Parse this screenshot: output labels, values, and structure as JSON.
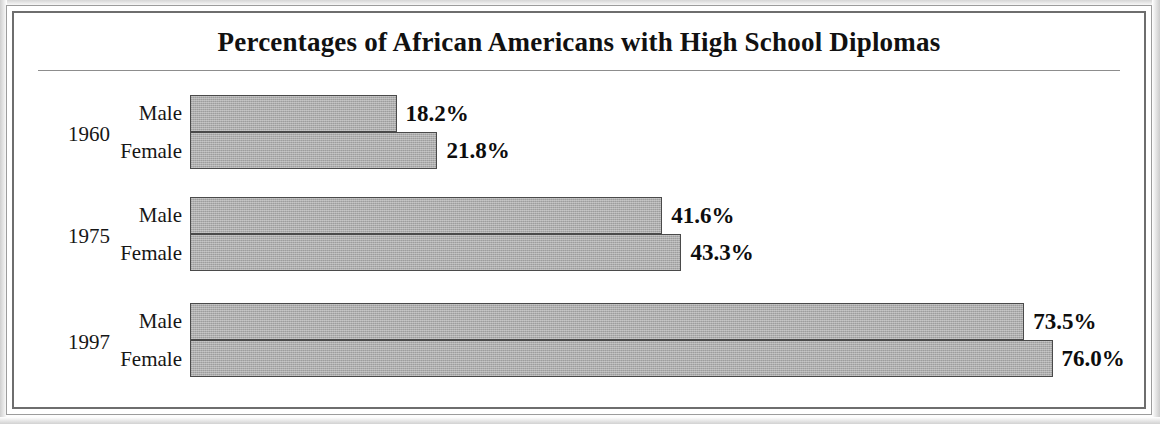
{
  "figure": {
    "title": "Percentages of African Americans with High School Diplomas",
    "background_color": "#ffffff",
    "bar_fill_color": "#a9a9a9",
    "bar_border_color": "#4a4a4a",
    "text_color": "#111111"
  },
  "chart_data": {
    "type": "bar",
    "orientation": "horizontal",
    "title": "Percentages of African Americans with High School Diplomas",
    "xlabel": "",
    "ylabel": "",
    "xlim": [
      0,
      76
    ],
    "grid": false,
    "legend": "none",
    "categories": [
      "1960",
      "1975",
      "1997"
    ],
    "series": [
      {
        "name": "Male",
        "values": [
          18.2,
          41.6,
          73.5
        ]
      },
      {
        "name": "Female",
        "values": [
          21.8,
          43.3,
          76.0
        ]
      }
    ],
    "groups": [
      {
        "year": "1960",
        "bars": [
          {
            "label": "Male",
            "value": 18.2,
            "value_text": "18.2%"
          },
          {
            "label": "Female",
            "value": 21.8,
            "value_text": "21.8%"
          }
        ]
      },
      {
        "year": "1975",
        "bars": [
          {
            "label": "Male",
            "value": 41.6,
            "value_text": "41.6%"
          },
          {
            "label": "Female",
            "value": 43.3,
            "value_text": "43.3%"
          }
        ]
      },
      {
        "year": "1997",
        "bars": [
          {
            "label": "Male",
            "value": 73.5,
            "value_text": "73.5%"
          },
          {
            "label": "Female",
            "value": 76.0,
            "value_text": "76.0%"
          }
        ]
      }
    ]
  }
}
